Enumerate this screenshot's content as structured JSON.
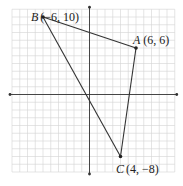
{
  "diagram": {
    "type": "coordinate-plane-triangle",
    "grid": {
      "xmin": -10,
      "xmax": 11,
      "ymin": -10,
      "ymax": 11,
      "step": 1
    },
    "axes": {
      "x_arrows": true,
      "y_arrows": true
    },
    "points": [
      {
        "name": "A",
        "coords": "(6, 6)",
        "x": 6,
        "y": 6
      },
      {
        "name": "B",
        "coords": "(−6, 10)",
        "x": -6,
        "y": 10
      },
      {
        "name": "C",
        "coords": "(4, −8)",
        "x": 4,
        "y": -8
      }
    ],
    "segments": [
      [
        "A",
        "B"
      ],
      [
        "B",
        "C"
      ],
      [
        "C",
        "A"
      ]
    ],
    "colors": {
      "grid": "#d4d4d4",
      "axis": "#333333",
      "line": "#333333"
    }
  }
}
